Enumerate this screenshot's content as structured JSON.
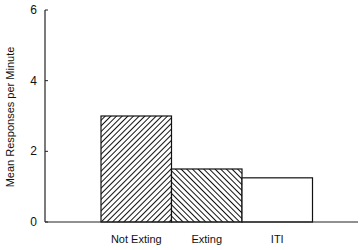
{
  "chart_data": {
    "type": "bar",
    "title": "",
    "xlabel": "",
    "ylabel": "Mean Responses per Minute",
    "ylim": [
      0,
      6
    ],
    "yticks": [
      0,
      2,
      4,
      6
    ],
    "categories": [
      "Not Exting",
      "Exting",
      "ITI"
    ],
    "values": [
      3.0,
      1.5,
      1.25
    ],
    "fills": [
      "hatch-forward",
      "hatch-backward",
      "none"
    ],
    "grid": false,
    "legend": "none"
  }
}
